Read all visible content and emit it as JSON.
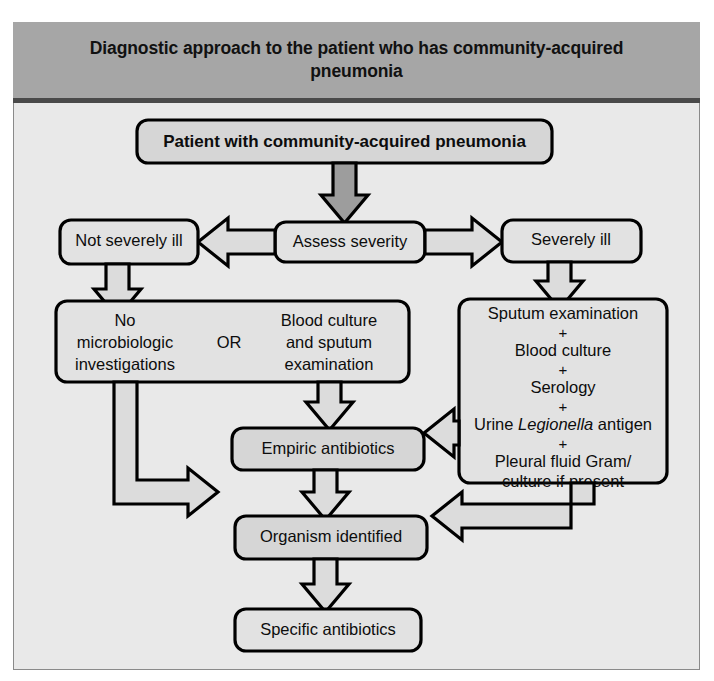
{
  "figure": {
    "title": "Diagnostic approach to the patient who has community-acquired pneumonia"
  },
  "nodes": {
    "patient": {
      "label": "Patient with community-acquired pneumonia"
    },
    "assess": {
      "label": "Assess severity"
    },
    "not_severe": {
      "label": "Not severely ill"
    },
    "severe": {
      "label": "Severely ill"
    },
    "mild_workup": {
      "option_a_line1": "No",
      "option_a_line2": "microbiologic",
      "option_a_line3": "investigations",
      "connector": "OR",
      "option_b_line1": "Blood culture",
      "option_b_line2": "and sputum",
      "option_b_line3": "examination"
    },
    "severe_workup": {
      "line1": "Sputum examination",
      "plus1": "+",
      "line2": "Blood culture",
      "plus2": "+",
      "line3": "Serology",
      "plus3": "+",
      "line4_pre": "Urine ",
      "line4_italic": "Legionella",
      "line4_post": " antigen",
      "plus4": "+",
      "line5": "Pleural fluid Gram/",
      "line6": "culture if present"
    },
    "empiric": {
      "label": "Empiric antibiotics"
    },
    "organism": {
      "label": "Organism identified"
    },
    "specific": {
      "label": "Specific antibiotics"
    }
  },
  "colors": {
    "header_band": "#a6a6a6",
    "header_rule": "#4a4a4a",
    "canvas": "#e9e9e9",
    "node_fill": "#d6d6d6",
    "arrow_fill": "#dcdcdc",
    "arrow_fill_dark": "#9d9d9d",
    "outline": "#000000"
  }
}
